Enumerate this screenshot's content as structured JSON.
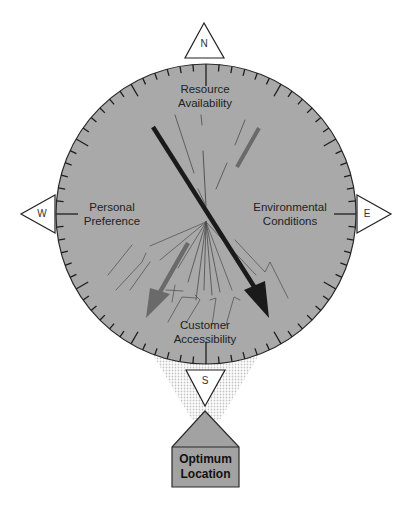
{
  "diagram": {
    "compass": {
      "directions": {
        "north": "N",
        "south": "S",
        "east": "E",
        "west": "W"
      },
      "factors": {
        "north": [
          "Resource",
          "Availability"
        ],
        "west": [
          "Personal",
          "Preference"
        ],
        "east": [
          "Environmental",
          "Conditions"
        ],
        "south": [
          "Customer",
          "Accessibility"
        ]
      }
    },
    "result": {
      "line1": "Optimum",
      "line2": "Location"
    },
    "colors": {
      "dial_fill": "#a9a9a9",
      "dial_edge": "#2a2a2a",
      "black_arrow": "#1a1a1a",
      "gray_arrow": "#6a6a6a",
      "result_fill": "#a2a2a2",
      "funnel": "#d8d8d8"
    }
  }
}
